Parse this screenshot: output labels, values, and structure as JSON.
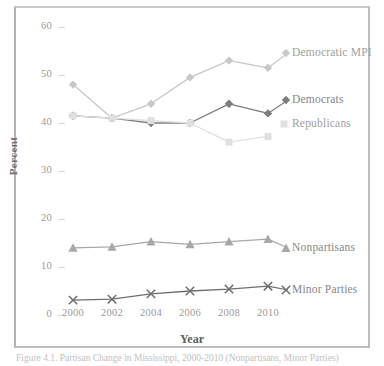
{
  "figure": {
    "caption": "Figure 4.1.   Partisan Change in Mississippi, 2000-2010 (Nonpartisans, Minor Parties)"
  },
  "chart_data": {
    "type": "line",
    "title": "",
    "xlabel": "Year",
    "ylabel": "Percent",
    "categories": [
      "2000",
      "2002",
      "2004",
      "2006",
      "2008",
      "2010"
    ],
    "x": [
      2000,
      2002,
      2004,
      2006,
      2008,
      2010
    ],
    "xlim": [
      1999,
      2011
    ],
    "ylim": [
      0,
      60
    ],
    "yticks": [
      0,
      10,
      20,
      30,
      40,
      50,
      60
    ],
    "ytick_labels": [
      "0",
      "10",
      "20",
      "30",
      "40",
      "50",
      "60"
    ],
    "grid": false,
    "legend_position": "right-inline-labels",
    "series": [
      {
        "name": "Democratic MPI",
        "values": [
          48,
          41,
          44,
          49.5,
          53,
          51.5
        ],
        "color": "#c8c8c8",
        "marker": "diamond"
      },
      {
        "name": "Democrats",
        "values": [
          41.5,
          41,
          40,
          40,
          44,
          42
        ],
        "color": "#7d7d7d",
        "marker": "diamond"
      },
      {
        "name": "Republicans",
        "values": [
          41.5,
          41,
          40.5,
          40,
          36,
          37.2
        ],
        "color": "#e0e0e0",
        "marker": "square"
      },
      {
        "name": "Nonpartisans",
        "values": [
          14,
          14.2,
          15.3,
          14.7,
          15.3,
          15.8
        ],
        "color": "#a8a8a8",
        "marker": "triangle"
      },
      {
        "name": "Minor Parties",
        "values": [
          3.1,
          3.3,
          4.4,
          5.0,
          5.4,
          6.0
        ],
        "color": "#6f6f6f",
        "marker": "cross"
      }
    ]
  }
}
